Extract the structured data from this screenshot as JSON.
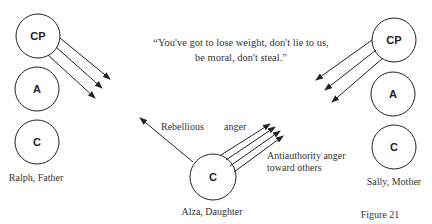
{
  "figure": {
    "caption": "Figure 21"
  },
  "quote": {
    "line1": "“You've got to lose weight, don't lie to us,",
    "line2": "be moral, don't steal.”"
  },
  "father": {
    "name": "Ralph, Father",
    "states": [
      "CP",
      "A",
      "C"
    ]
  },
  "mother": {
    "name": "Sally, Mother",
    "states": [
      "CP",
      "A",
      "C"
    ]
  },
  "daughter": {
    "name": "Alza, Daughter",
    "state": "C"
  },
  "labels": {
    "rebellious": "Rebellious",
    "anger": "anger",
    "antiauthority1": "Antiauthority anger",
    "antiauthority2": "toward others"
  },
  "colors": {
    "stroke": "#222222",
    "text": "#333333"
  }
}
